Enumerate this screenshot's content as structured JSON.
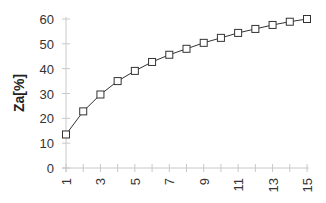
{
  "chart_data": {
    "type": "line",
    "title": "",
    "xlabel": "",
    "ylabel": "Za[%]",
    "x": [
      1,
      2,
      3,
      4,
      5,
      6,
      7,
      8,
      9,
      10,
      11,
      12,
      13,
      14,
      15
    ],
    "series": [
      {
        "name": "Za",
        "values": [
          13.5,
          22.8,
          29.6,
          35.0,
          39.1,
          42.7,
          45.6,
          48.0,
          50.4,
          52.4,
          54.4,
          56.0,
          57.6,
          58.9,
          60.0
        ],
        "marker": "square-open",
        "color": "#333333"
      }
    ],
    "xlim": [
      1,
      15
    ],
    "ylim": [
      0,
      60
    ],
    "yticks": [
      0,
      10,
      20,
      30,
      40,
      50,
      60
    ],
    "xtick_labels": [
      "1",
      "3",
      "5",
      "7",
      "9",
      "11",
      "13",
      "15"
    ],
    "xtick_label_rotation": -90,
    "grid": false,
    "legend": null
  },
  "colors": {
    "axis": "#c8c8c8",
    "line": "#333333",
    "marker_fill": "#ffffff",
    "text": "#333333"
  }
}
